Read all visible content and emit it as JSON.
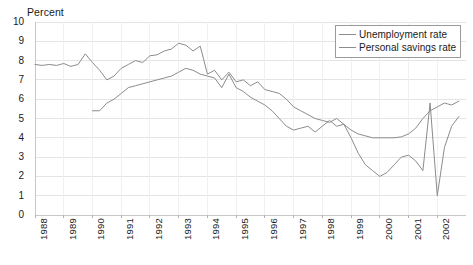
{
  "chart_data": {
    "type": "line",
    "title": "",
    "ylabel": "Percent",
    "xlabel": "",
    "ylim": [
      0,
      10
    ],
    "ytick_step": 1,
    "yticks": [
      "0",
      "1",
      "2",
      "3",
      "4",
      "5",
      "6",
      "7",
      "8",
      "9",
      "10"
    ],
    "grid": true,
    "grid_axis": "y",
    "legend_position": "top-right",
    "categories": [
      "1988",
      "1989",
      "1990",
      "1991",
      "1992",
      "1993",
      "1994",
      "1995",
      "1996",
      "1997",
      "1998",
      "1999",
      "2000",
      "2001",
      "2002"
    ],
    "x_start": 1988,
    "x_end": 2003,
    "x_resolution": "quarterly",
    "series": [
      {
        "name": "Unemployment rate",
        "color": "#8c8c8c",
        "x": [
          1988.0,
          1988.25,
          1988.5,
          1988.75,
          1989.0,
          1989.25,
          1989.5,
          1989.75,
          1990.0,
          1990.25,
          1990.5,
          1990.75,
          1991.0,
          1991.25,
          1991.5,
          1991.75,
          1992.0,
          1992.25,
          1992.5,
          1992.75,
          1993.0,
          1993.25,
          1993.5,
          1993.75,
          1994.0,
          1994.25,
          1994.5,
          1994.75,
          1995.0,
          1995.25,
          1995.5,
          1995.75,
          1996.0,
          1996.25,
          1996.5,
          1996.75,
          1997.0,
          1997.25,
          1997.5,
          1997.75,
          1998.0,
          1998.25,
          1998.5,
          1998.75,
          1999.0,
          1999.25,
          1999.5,
          1999.75,
          2000.0,
          2000.25,
          2000.5,
          2000.75,
          2001.0,
          2001.25,
          2001.5,
          2001.75,
          2002.0,
          2002.25,
          2002.5,
          2002.75
        ],
        "values": [
          7.8,
          7.75,
          7.8,
          7.75,
          7.85,
          7.7,
          7.8,
          8.35,
          7.9,
          7.5,
          7.0,
          7.2,
          7.6,
          7.8,
          8.0,
          7.9,
          8.25,
          8.3,
          8.5,
          8.6,
          8.9,
          8.8,
          8.5,
          8.75,
          7.3,
          7.5,
          7.0,
          7.4,
          6.9,
          7.0,
          6.7,
          6.9,
          6.5,
          6.4,
          6.3,
          6.0,
          5.6,
          5.4,
          5.2,
          5.0,
          4.9,
          4.8,
          5.0,
          4.7,
          4.4,
          4.2,
          4.1,
          4.0,
          4.0,
          4.0,
          4.0,
          4.05,
          4.2,
          4.5,
          5.0,
          5.4,
          5.6,
          5.8,
          5.7,
          5.9
        ]
      },
      {
        "name": "Personal savings rate",
        "color": "#8c8c8c",
        "x": [
          1990.0,
          1990.25,
          1990.5,
          1990.75,
          1991.0,
          1991.25,
          1991.5,
          1991.75,
          1992.0,
          1992.25,
          1992.5,
          1992.75,
          1993.0,
          1993.25,
          1993.5,
          1993.75,
          1994.0,
          1994.25,
          1994.5,
          1994.75,
          1995.0,
          1995.25,
          1995.5,
          1995.75,
          1996.0,
          1996.25,
          1996.5,
          1996.75,
          1997.0,
          1997.25,
          1997.5,
          1997.75,
          1998.0,
          1998.25,
          1998.5,
          1998.75,
          1999.0,
          1999.25,
          1999.5,
          1999.75,
          2000.0,
          2000.25,
          2000.5,
          2000.75,
          2001.0,
          2001.25,
          2001.5,
          2001.75,
          2002.0,
          2002.25,
          2002.5,
          2002.75
        ],
        "values": [
          5.4,
          5.4,
          5.8,
          6.0,
          6.3,
          6.6,
          6.7,
          6.8,
          6.9,
          7.0,
          7.1,
          7.2,
          7.4,
          7.6,
          7.5,
          7.3,
          7.2,
          7.1,
          6.6,
          7.3,
          6.6,
          6.4,
          6.1,
          5.9,
          5.7,
          5.4,
          5.0,
          4.6,
          4.4,
          4.5,
          4.6,
          4.3,
          4.6,
          4.9,
          4.6,
          4.7,
          4.0,
          3.2,
          2.6,
          2.3,
          2.0,
          2.2,
          2.6,
          3.0,
          3.1,
          2.8,
          2.3,
          5.8,
          1.0,
          3.5,
          4.6,
          5.1
        ]
      }
    ]
  },
  "axis": {
    "ylabel": "Percent"
  },
  "legend": {
    "items": [
      {
        "label": "Unemployment rate"
      },
      {
        "label": "Personal savings rate"
      }
    ]
  }
}
